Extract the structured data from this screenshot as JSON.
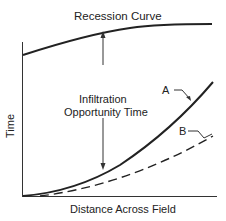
{
  "title": "Recession Curve",
  "annotation": {
    "line1": "Infiltration",
    "line2": "Opportunity Time"
  },
  "xlabel": "Distance Across Field",
  "ylabel": "Time",
  "curve_labels": {
    "a": "A",
    "b": "B"
  },
  "colors": {
    "line": "#222222",
    "background": "#ffffff"
  }
}
